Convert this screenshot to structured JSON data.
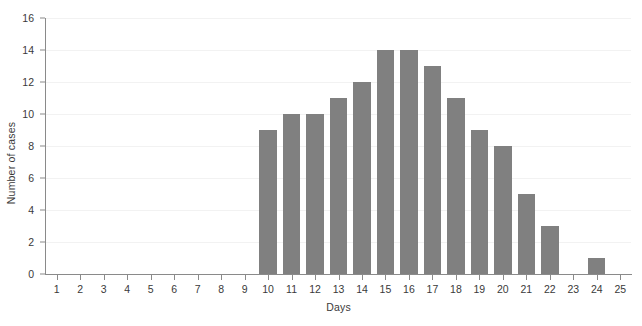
{
  "chart_data": {
    "type": "bar",
    "title": "",
    "xlabel": "Days",
    "ylabel": "Number of cases",
    "categories": [
      "1",
      "2",
      "3",
      "4",
      "5",
      "6",
      "7",
      "8",
      "9",
      "10",
      "11",
      "12",
      "13",
      "14",
      "15",
      "16",
      "17",
      "18",
      "19",
      "20",
      "21",
      "22",
      "23",
      "24",
      "25"
    ],
    "values": [
      0,
      0,
      0,
      0,
      0,
      0,
      0,
      0,
      0,
      9,
      10,
      10,
      11,
      12,
      14,
      14,
      13,
      11,
      9,
      8,
      5,
      3,
      0,
      1,
      0
    ],
    "xlim": [
      0.5,
      25.5
    ],
    "ylim": [
      0,
      16
    ],
    "ytick_labels": [
      "0",
      "2",
      "4",
      "6",
      "8",
      "10",
      "12",
      "14",
      "16"
    ],
    "ytick_values": [
      0,
      2,
      4,
      6,
      8,
      10,
      12,
      14,
      16
    ],
    "xtick_labels": [
      "1",
      "2",
      "3",
      "4",
      "5",
      "6",
      "7",
      "8",
      "9",
      "10",
      "11",
      "12",
      "13",
      "14",
      "15",
      "16",
      "17",
      "18",
      "19",
      "20",
      "21",
      "22",
      "23",
      "24",
      "25"
    ],
    "grid": "horizontal",
    "legend": "none",
    "bar_color": "#808080",
    "grid_color": "#f2f2f2",
    "axis_color": "#8a8a8a",
    "text_color": "#3a3a3a",
    "background_color": "#ffffff"
  }
}
